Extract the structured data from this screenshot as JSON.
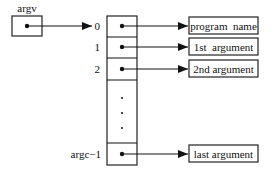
{
  "diagram": {
    "pointer": {
      "label": "argv"
    },
    "array": {
      "rows": [
        {
          "index": "0",
          "target": "program  name"
        },
        {
          "index": "1",
          "target": "1st  argument"
        },
        {
          "index": "2",
          "target": "2nd argument"
        },
        {
          "index": "argc−1",
          "target": "last argument"
        }
      ],
      "ellipsis": "⋮"
    },
    "colors": {
      "stroke": "#222222",
      "background": "#ffffff"
    }
  }
}
